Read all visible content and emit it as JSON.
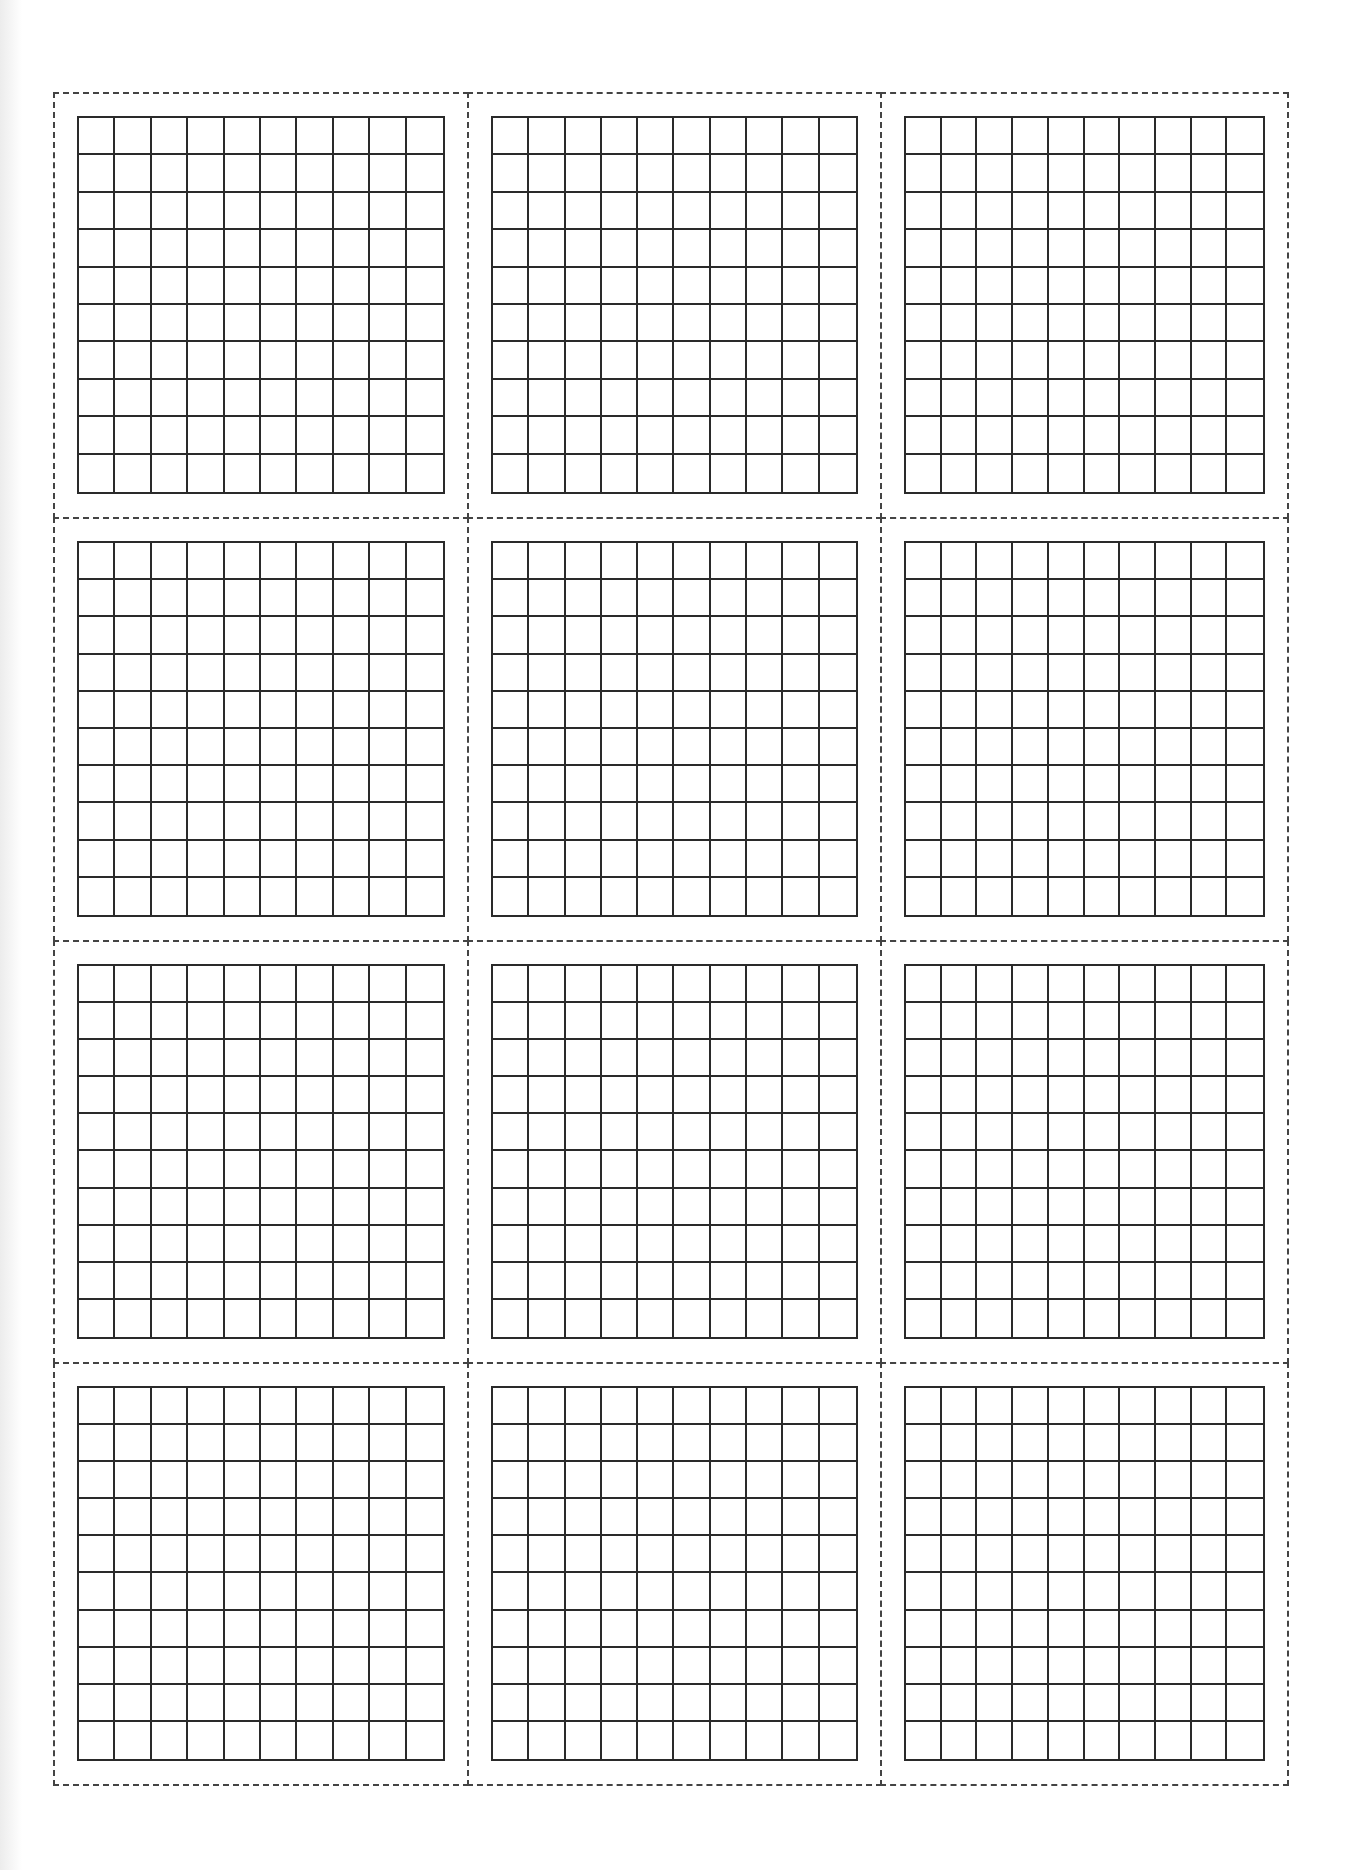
{
  "document": {
    "type": "hundred-square grid worksheet",
    "layout": {
      "columns": 3,
      "rows": 4
    },
    "grid": {
      "columns": 10,
      "rows": 10
    },
    "colors": {
      "grid_line": "#2a2a2a",
      "cut_line": "#444444",
      "paper": "#ffffff"
    },
    "panels": [
      {
        "id": 1,
        "row": 1,
        "col": 1
      },
      {
        "id": 2,
        "row": 1,
        "col": 2
      },
      {
        "id": 3,
        "row": 1,
        "col": 3
      },
      {
        "id": 4,
        "row": 2,
        "col": 1
      },
      {
        "id": 5,
        "row": 2,
        "col": 2
      },
      {
        "id": 6,
        "row": 2,
        "col": 3
      },
      {
        "id": 7,
        "row": 3,
        "col": 1
      },
      {
        "id": 8,
        "row": 3,
        "col": 2
      },
      {
        "id": 9,
        "row": 3,
        "col": 3
      },
      {
        "id": 10,
        "row": 4,
        "col": 1
      },
      {
        "id": 11,
        "row": 4,
        "col": 2
      },
      {
        "id": 12,
        "row": 4,
        "col": 3
      }
    ]
  }
}
